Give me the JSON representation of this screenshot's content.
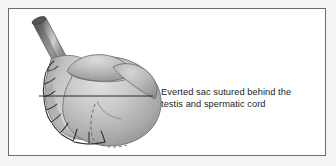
{
  "figure": {
    "type": "medical-illustration",
    "background_color": "#ffffff",
    "frame_color": "#6d6d6d",
    "outer_margin_color": "#f4f4f4"
  },
  "annotation": {
    "label_text": "Everted sac sutured behind the\ntestis and spermatic cord",
    "line1": "Everted sac sutured behind the",
    "line2": "testis and spermatic cord",
    "text_color": "#1d1d1d",
    "leader_line_color": "#2a2a2a"
  },
  "anatomy": {
    "parts": [
      {
        "name": "spermatic-cord",
        "description": "Tubular cord angled to upper left",
        "shade": "#8e8e8e"
      },
      {
        "name": "testis-body",
        "description": "Large rounded testis body",
        "shade": "#b9b9b9"
      },
      {
        "name": "everted-sac-fold",
        "description": "Everted tunica vaginalis sac folded behind testis",
        "shade": "#a8a8a8"
      },
      {
        "name": "suture-line",
        "description": "Running suture stitches along left margin",
        "shade": "#3a3a3a"
      },
      {
        "name": "hidden-contour",
        "description": "Dashed line showing hidden sac border",
        "shade": "#5a5a5a"
      }
    ]
  }
}
